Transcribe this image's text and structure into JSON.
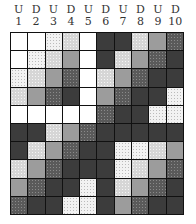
{
  "header": {
    "columns": [
      {
        "letter": "U",
        "number": "1"
      },
      {
        "letter": "D",
        "number": "2"
      },
      {
        "letter": "U",
        "number": "3"
      },
      {
        "letter": "D",
        "number": "4"
      },
      {
        "letter": "U",
        "number": "5"
      },
      {
        "letter": "D",
        "number": "6"
      },
      {
        "letter": "U",
        "number": "7"
      },
      {
        "letter": "D",
        "number": "8"
      },
      {
        "letter": "U",
        "number": "9"
      },
      {
        "letter": "D",
        "number": "10"
      }
    ]
  },
  "shade_legend": {
    "0": "white",
    "1": "light-speckle",
    "2": "medium-speckle",
    "3": "gray",
    "4": "dark-speckle",
    "5": "dark"
  },
  "grid": {
    "rows": [
      [
        0,
        0,
        1,
        2,
        0,
        5,
        5,
        2,
        3,
        4
      ],
      [
        0,
        1,
        2,
        3,
        0,
        5,
        2,
        3,
        4,
        5
      ],
      [
        1,
        2,
        3,
        4,
        0,
        2,
        3,
        4,
        5,
        5
      ],
      [
        2,
        3,
        4,
        5,
        0,
        3,
        4,
        5,
        5,
        1
      ],
      [
        0,
        0,
        0,
        0,
        0,
        4,
        5,
        5,
        1,
        1
      ],
      [
        5,
        5,
        2,
        3,
        4,
        5,
        5,
        5,
        5,
        5
      ],
      [
        5,
        2,
        3,
        4,
        5,
        5,
        1,
        1,
        2,
        3
      ],
      [
        2,
        3,
        4,
        5,
        5,
        5,
        1,
        2,
        3,
        4
      ],
      [
        3,
        4,
        5,
        5,
        1,
        5,
        2,
        3,
        4,
        5
      ],
      [
        4,
        5,
        5,
        1,
        1,
        5,
        3,
        4,
        5,
        5
      ]
    ]
  }
}
